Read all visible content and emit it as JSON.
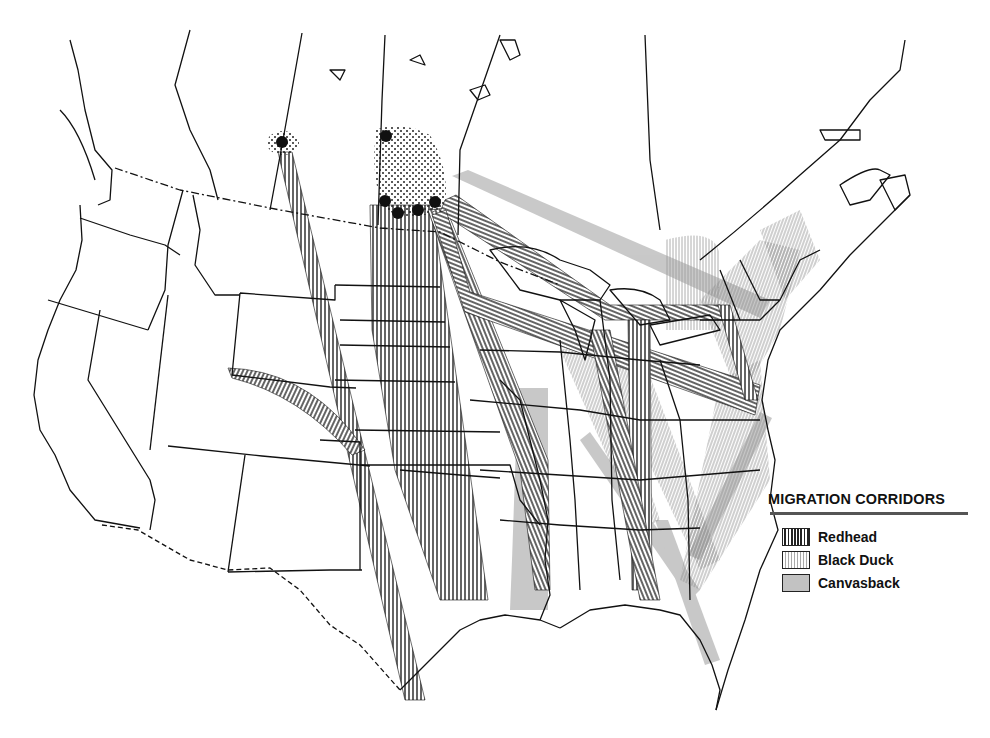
{
  "map": {
    "title": "Waterfowl Migration Corridors",
    "region": "United States and southern Canada",
    "colors": {
      "line": "#111111",
      "redhead": "#222222",
      "black_duck": "#9a9a9a",
      "canvasback": "#c2c2c2",
      "breeding_area": "#333333"
    },
    "breeding_markers": [
      {
        "name": "breeding-site-alberta",
        "x": 282,
        "y": 142
      },
      {
        "name": "breeding-site-manitoba-north",
        "x": 386,
        "y": 136
      },
      {
        "name": "breeding-site-manitoba-sw",
        "x": 385,
        "y": 201
      },
      {
        "name": "breeding-site-manitoba-s1",
        "x": 398,
        "y": 213
      },
      {
        "name": "breeding-site-manitoba-s2",
        "x": 418,
        "y": 210
      },
      {
        "name": "breeding-site-manitoba-se",
        "x": 435,
        "y": 202
      }
    ]
  },
  "legend": {
    "title": "MIGRATION CORRIDORS",
    "items": [
      {
        "label": "Redhead",
        "pattern": "dense-vertical-hatch"
      },
      {
        "label": "Black Duck",
        "pattern": "light-vertical-hatch"
      },
      {
        "label": "Canvasback",
        "pattern": "gray-fill"
      }
    ]
  }
}
